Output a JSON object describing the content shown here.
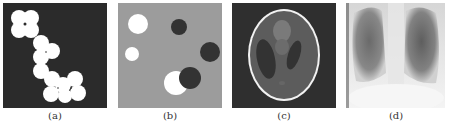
{
  "figure": {
    "panels": [
      {
        "id": "a",
        "label": "(a)",
        "description": "white overlapping disks on dark background (binary shapes)",
        "background": "#2b2b2b",
        "foreground": "#ffffff"
      },
      {
        "id": "b",
        "label": "(b)",
        "description": "bright and dark disks on gray background",
        "background": "#9c9c9c",
        "bright": "#ffffff",
        "dark": "#333333"
      },
      {
        "id": "c",
        "label": "(c)",
        "description": "Shepp-Logan phantom",
        "background": "#2f2f2f",
        "ellipse": "#5c5c5c",
        "outline": "#f2f2f2"
      },
      {
        "id": "d",
        "label": "(d)",
        "description": "chest X-ray radiograph",
        "background": "#e8e8e8"
      }
    ]
  }
}
